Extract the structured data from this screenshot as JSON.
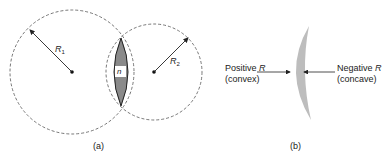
{
  "figure_a": {
    "caption": "(a)",
    "radius1_label": "R",
    "radius1_sub": "1",
    "radius2_label": "R",
    "radius2_sub": "2",
    "lens_index_label": "n"
  },
  "figure_b": {
    "caption": "(b)",
    "left_label_line1": "Positive",
    "left_label_italic": "R",
    "left_label_line2": "(convex)",
    "right_label_line1": "Negative",
    "right_label_italic": "R",
    "right_label_line2": "(concave)"
  },
  "colors": {
    "lens_fill": "#8a8a8a",
    "meniscus_fill": "#bdbdbd",
    "line": "#333333"
  }
}
